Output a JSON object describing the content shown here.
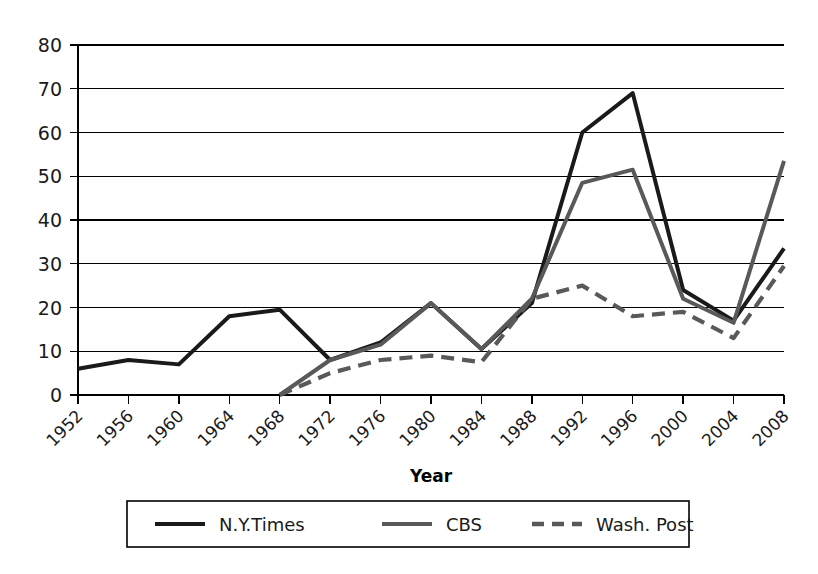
{
  "chart_data": {
    "type": "line",
    "title": "",
    "xlabel": "Year",
    "ylabel": "",
    "categories": [
      "1952",
      "1956",
      "1960",
      "1964",
      "1968",
      "1972",
      "1976",
      "1980",
      "1984",
      "1988",
      "1992",
      "1996",
      "2000",
      "2004",
      "2008"
    ],
    "xlim": [
      "1952",
      "2008"
    ],
    "ylim": [
      0,
      80
    ],
    "ytick_labels": [
      "0",
      "10",
      "20",
      "30",
      "40",
      "50",
      "60",
      "70",
      "80"
    ],
    "ytick_values": [
      0,
      10,
      20,
      30,
      40,
      50,
      60,
      70,
      80
    ],
    "grid": "horizontal",
    "legend_position": "bottom",
    "series": [
      {
        "name": "N.Y.Times",
        "style": "solid",
        "color": "#1a1a1a",
        "values": [
          6,
          8,
          7,
          18,
          19.5,
          8,
          12,
          21,
          10.5,
          21,
          60,
          69,
          24,
          17,
          33.5
        ]
      },
      {
        "name": "CBS",
        "style": "solid",
        "color": "#595959",
        "values": [
          null,
          null,
          null,
          null,
          0,
          8,
          11.5,
          21,
          10.5,
          22,
          48.5,
          51.5,
          22,
          16.5,
          53.5
        ]
      },
      {
        "name": "Wash. Post",
        "style": "dashed",
        "color": "#595959",
        "values": [
          null,
          null,
          null,
          null,
          0,
          5,
          8,
          9,
          7.5,
          22,
          25,
          18,
          19,
          13,
          29.5
        ]
      }
    ]
  },
  "legend": {
    "items": [
      {
        "label": "N.Y.Times",
        "style": "solid",
        "color": "#1a1a1a"
      },
      {
        "label": "CBS",
        "style": "solid",
        "color": "#595959"
      },
      {
        "label": "Wash. Post",
        "style": "dashed",
        "color": "#595959"
      }
    ]
  },
  "axis": {
    "x_title": "Year"
  }
}
